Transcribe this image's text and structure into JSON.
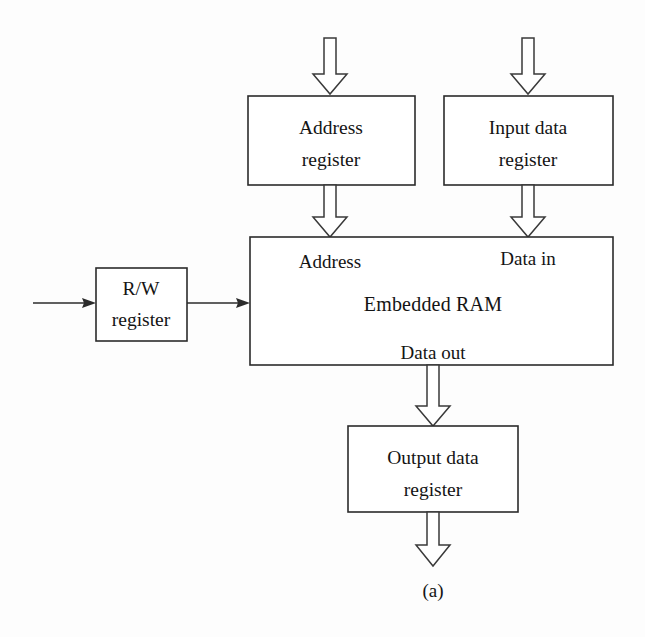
{
  "figure": {
    "caption": "(a)"
  },
  "colors": {
    "background": "#fdfdfd",
    "stroke": "#2b2b2b",
    "arrow_stroke": "#3a3a3a",
    "box_fill": "#ffffff",
    "text": "#141414"
  },
  "blocks": {
    "address_register": {
      "line1": "Address",
      "line2": "register"
    },
    "input_data_register": {
      "line1": "Input data",
      "line2": "register"
    },
    "rw_register": {
      "line1": "R/W",
      "line2": "register"
    },
    "embedded_ram": {
      "title": "Embedded  RAM",
      "port_address": "Address",
      "port_data_in": "Data in",
      "port_data_out": "Data out"
    },
    "output_data_register": {
      "line1": "Output data",
      "line2": "register"
    }
  },
  "arrows": [
    {
      "name": "address-input-arrow",
      "kind": "block-arrow",
      "direction": "down"
    },
    {
      "name": "data-input-arrow",
      "kind": "block-arrow",
      "direction": "down"
    },
    {
      "name": "address-to-ram-arrow",
      "kind": "block-arrow",
      "direction": "down"
    },
    {
      "name": "input-data-to-ram-arrow",
      "kind": "block-arrow",
      "direction": "down"
    },
    {
      "name": "rw-external-input-arrow",
      "kind": "thin-arrow",
      "direction": "right"
    },
    {
      "name": "rw-to-ram-arrow",
      "kind": "thin-arrow",
      "direction": "right"
    },
    {
      "name": "data-out-to-output-register-arrow",
      "kind": "block-arrow",
      "direction": "down"
    },
    {
      "name": "output-data-arrow",
      "kind": "block-arrow",
      "direction": "down"
    }
  ]
}
